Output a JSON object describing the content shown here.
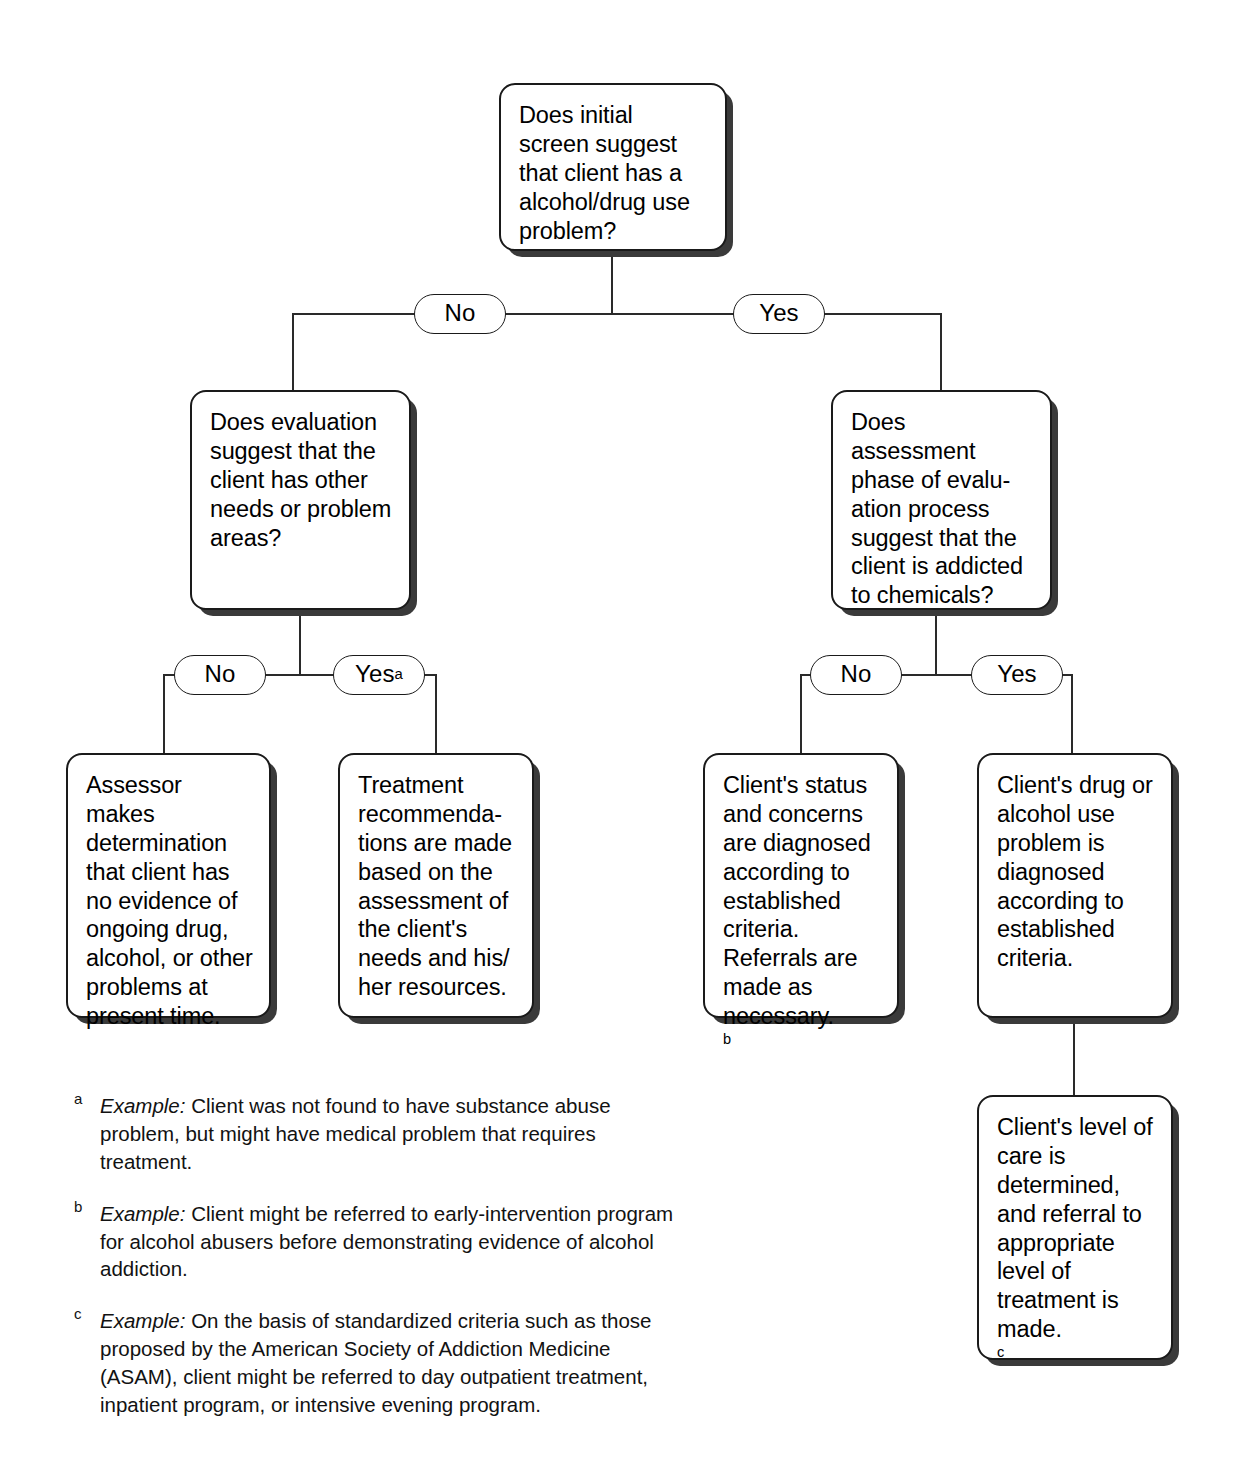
{
  "diagram": {
    "nodes": {
      "root": "Does initial screen suggest that client has a alcohol/drug use problem?",
      "left_decision": "Does evaluation suggest that the client has other needs or problem areas?",
      "right_decision": "Does assessment phase of evalu-\nation process suggest that the client is addicted to chemicals?",
      "left_no_outcome": "Assessor makes determination that client has no evidence of ongoing drug, alcohol, or other problems at present time.",
      "left_yes_outcome": "Treatment recommenda-\ntions are made based on the assessment of the client's needs and his/\nher resources.",
      "right_no_outcome": "Client's status and concerns are diagnosed according to established criteria. Referrals are made as necessary.",
      "right_no_outcome_fn": "b",
      "right_yes_outcome": "Client's drug or alcohol use problem is diagnosed according to established criteria.",
      "right_final_outcome": "Client's level of care is determined, and referral to appropriate level of treatment is made.",
      "right_final_outcome_fn": "c"
    },
    "branch_labels": {
      "root_no": "No",
      "root_yes": "Yes",
      "left_no": "No",
      "left_yes": "Yes",
      "left_yes_fn": "a",
      "right_no": "No",
      "right_yes": "Yes"
    },
    "footnotes": [
      {
        "marker": "a",
        "lead": "Example:",
        "body": " Client was not found to have substance abuse problem, but might have medical problem that requires treatment."
      },
      {
        "marker": "b",
        "lead": "Example:",
        "body": " Client might be referred to early-intervention program for alcohol abusers before demonstrating evidence of alcohol addiction."
      },
      {
        "marker": "c",
        "lead": "Example:",
        "body": " On the basis of standardized criteria such as those proposed by the American Society of Addiction Medicine (ASAM), client might be referred to day outpatient treatment, inpatient program, or intensive evening program."
      }
    ],
    "colors": {
      "line": "#2a2a2a",
      "border": "#1a1a1a",
      "shadow": "#3a3a3a",
      "background": "#ffffff"
    }
  }
}
